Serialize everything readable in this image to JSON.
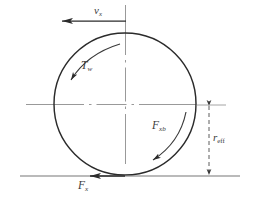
{
  "figure": {
    "background_color": "#ffffff",
    "stroke_color": "#2b2b2b",
    "axis_color": "#8a8a8a",
    "label_color": "#3a3a3a"
  },
  "labels": {
    "velocity": {
      "symbol": "v",
      "subscript": "x",
      "full": "v_x"
    },
    "wheel_torque": {
      "symbol": "T",
      "subscript": "w",
      "full": "T_w"
    },
    "brake_force": {
      "symbol": "F",
      "subscript": "xb",
      "full": "F_xb"
    },
    "ground_force": {
      "symbol": "F",
      "subscript": "x",
      "full": "F_x"
    },
    "effective_radius": {
      "symbol": "r",
      "subscript": "eff",
      "full": "r_eff"
    }
  },
  "elements": {
    "wheel_circle": "wheel-circle",
    "vertical_axis": "vertical-center-axis",
    "horizontal_axis": "horizontal-center-axis",
    "ground_line": "ground-line",
    "velocity_arrow": "velocity-arrow",
    "torque_arc_arrow": "torque-arc-arrow",
    "brake_arc_arrow": "brake-arc-arrow",
    "ground_force_arrow": "ground-force-arrow",
    "radius_dimension_line": "radius-dimension-line"
  },
  "geometry": {
    "circle_center_x": 125,
    "circle_center_y": 104,
    "circle_radius": 71,
    "ground_y": 176,
    "dimension_x": 209,
    "r_eff_top_y": 106,
    "r_eff_bottom_y": 176
  }
}
